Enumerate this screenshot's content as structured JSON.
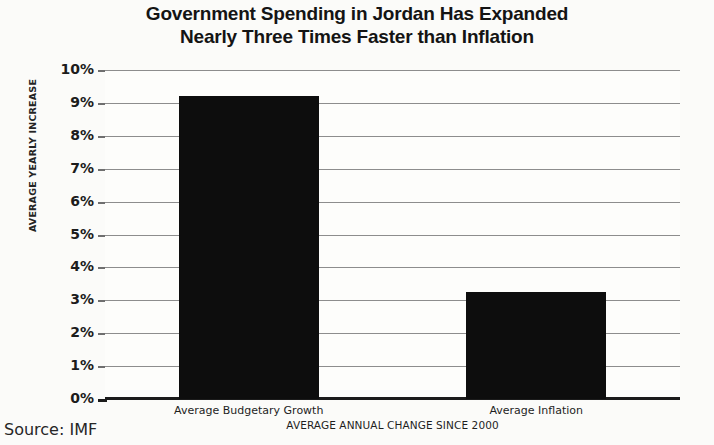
{
  "chart_data": {
    "type": "bar",
    "title": "Government Spending in Jordan Has Expanded Nearly Three Times Faster than Inflation",
    "title_lines": [
      "Government Spending in Jordan Has Expanded",
      "Nearly Three Times Faster than Inflation"
    ],
    "categories": [
      "Average Budgetary Growth",
      "Average Inflation"
    ],
    "values": [
      9.2,
      3.25
    ],
    "value_labels": [
      "9.2%",
      "3.25%"
    ],
    "xlabel": "AVERAGE ANNUAL CHANGE SINCE 2000",
    "ylabel": "AVERAGE YEARLY INCREASE",
    "ylim": [
      0,
      10
    ],
    "ytick_labels": [
      "10%",
      "9%",
      "8%",
      "7%",
      "6%",
      "5%",
      "4%",
      "3%",
      "2%",
      "1%",
      "0%"
    ],
    "ytick_values": [
      10,
      9,
      8,
      7,
      6,
      5,
      4,
      3,
      2,
      1,
      0
    ],
    "grid": true,
    "legend": false,
    "series_color": "#0d0d0d",
    "gridline_color": "#8d8d8d",
    "background_color": "#fbfbf9"
  },
  "source": {
    "label": "Source: IMF"
  }
}
